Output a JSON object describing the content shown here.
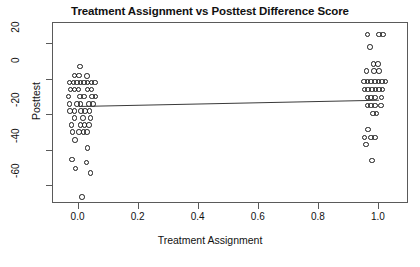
{
  "chart_data": {
    "type": "scatter",
    "title": "Treatment Assignment vs Posttest Difference Score",
    "xlabel": "Treatment Assignment",
    "ylabel": "Posttest",
    "xlim": [
      -0.085,
      1.1
    ],
    "ylim": [
      -70,
      32
    ],
    "grid": false,
    "legend": null,
    "xticks": [
      {
        "value": 0.0,
        "label": "0.0"
      },
      {
        "value": 0.2,
        "label": "0.2"
      },
      {
        "value": 0.4,
        "label": "0.4"
      },
      {
        "value": 0.6,
        "label": "0.6"
      },
      {
        "value": 0.8,
        "label": "0.8"
      },
      {
        "value": 1.0,
        "label": "1.0"
      }
    ],
    "yticks": [
      {
        "value": 20,
        "label": "20"
      },
      {
        "value": 0,
        "label": "0"
      },
      {
        "value": -20,
        "label": "-20"
      },
      {
        "value": -40,
        "label": "-40"
      },
      {
        "value": -60,
        "label": "-60"
      }
    ],
    "annotations": [
      {
        "type": "regression-line",
        "x_start": 0.0,
        "y_start": -14.5,
        "x_end": 1.0,
        "y_end": -11.0
      }
    ],
    "series": [
      {
        "name": "control",
        "x_group": 0.0,
        "marker": "open-circle",
        "color": "#1a1a1a",
        "points": [
          {
            "x": 0.004,
            "y": 7.5
          },
          {
            "x": -0.013,
            "y": 2.5
          },
          {
            "x": 0.002,
            "y": 2.5
          },
          {
            "x": 0.028,
            "y": 2.0
          },
          {
            "x": -0.03,
            "y": -1.5
          },
          {
            "x": -0.017,
            "y": -1.5
          },
          {
            "x": -0.005,
            "y": -1.5
          },
          {
            "x": 0.006,
            "y": -1.5
          },
          {
            "x": 0.018,
            "y": -1.5
          },
          {
            "x": 0.03,
            "y": -1.5
          },
          {
            "x": 0.043,
            "y": -1.5
          },
          {
            "x": 0.055,
            "y": -1.5
          },
          {
            "x": -0.027,
            "y": -5.5
          },
          {
            "x": -0.014,
            "y": -5.5
          },
          {
            "x": 0.0,
            "y": -5.5
          },
          {
            "x": 0.03,
            "y": -5.5
          },
          {
            "x": 0.043,
            "y": -5.5
          },
          {
            "x": -0.033,
            "y": -9.5
          },
          {
            "x": 0.005,
            "y": -9.5
          },
          {
            "x": 0.018,
            "y": -9.5
          },
          {
            "x": 0.044,
            "y": -9.5
          },
          {
            "x": 0.056,
            "y": -9.5
          },
          {
            "x": -0.03,
            "y": -13.5
          },
          {
            "x": -0.006,
            "y": -13.5
          },
          {
            "x": 0.006,
            "y": -13.5
          },
          {
            "x": 0.034,
            "y": -13.5
          },
          {
            "x": 0.048,
            "y": -13.5
          },
          {
            "x": -0.028,
            "y": -17.5
          },
          {
            "x": -0.014,
            "y": -17.5
          },
          {
            "x": 0.008,
            "y": -17.5
          },
          {
            "x": 0.022,
            "y": -17.5
          },
          {
            "x": 0.036,
            "y": -17.5
          },
          {
            "x": -0.014,
            "y": -21.5
          },
          {
            "x": 0.014,
            "y": -21.5
          },
          {
            "x": 0.04,
            "y": -21.5
          },
          {
            "x": -0.024,
            "y": -25.5
          },
          {
            "x": 0.006,
            "y": -25.5
          },
          {
            "x": 0.02,
            "y": -25.5
          },
          {
            "x": 0.034,
            "y": -25.5
          },
          {
            "x": -0.02,
            "y": -29.5
          },
          {
            "x": 0.002,
            "y": -29.5
          },
          {
            "x": 0.016,
            "y": -29.5
          },
          {
            "x": 0.028,
            "y": -29.5
          },
          {
            "x": -0.012,
            "y": -34.0
          },
          {
            "x": 0.03,
            "y": -38.5
          },
          {
            "x": -0.022,
            "y": -45.0
          },
          {
            "x": 0.026,
            "y": -46.5
          },
          {
            "x": -0.01,
            "y": -50.0
          },
          {
            "x": 0.04,
            "y": -52.5
          },
          {
            "x": 0.012,
            "y": -66.0
          }
        ]
      },
      {
        "name": "treatment",
        "x_group": 1.0,
        "marker": "open-circle",
        "color": "#1a1a1a",
        "points": [
          {
            "x": 0.962,
            "y": 25.5
          },
          {
            "x": 1.0,
            "y": 25.5
          },
          {
            "x": 1.014,
            "y": 25.5
          },
          {
            "x": 0.97,
            "y": 18.5
          },
          {
            "x": 0.982,
            "y": 9.0
          },
          {
            "x": 0.996,
            "y": 9.0
          },
          {
            "x": 0.958,
            "y": 5.0
          },
          {
            "x": 0.984,
            "y": 5.0
          },
          {
            "x": 1.0,
            "y": 5.0
          },
          {
            "x": 0.95,
            "y": -1.0
          },
          {
            "x": 0.962,
            "y": -1.0
          },
          {
            "x": 0.974,
            "y": -1.0
          },
          {
            "x": 0.986,
            "y": -1.0
          },
          {
            "x": 0.998,
            "y": -1.0
          },
          {
            "x": 1.01,
            "y": -1.0
          },
          {
            "x": 1.022,
            "y": -1.0
          },
          {
            "x": 0.952,
            "y": -5.5
          },
          {
            "x": 0.964,
            "y": -5.5
          },
          {
            "x": 0.976,
            "y": -5.5
          },
          {
            "x": 0.988,
            "y": -5.5
          },
          {
            "x": 1.0,
            "y": -5.5
          },
          {
            "x": 1.012,
            "y": -5.5
          },
          {
            "x": 0.962,
            "y": -10.0
          },
          {
            "x": 0.974,
            "y": -10.0
          },
          {
            "x": 0.986,
            "y": -10.0
          },
          {
            "x": 1.008,
            "y": -10.0
          },
          {
            "x": 0.962,
            "y": -14.5
          },
          {
            "x": 0.974,
            "y": -14.5
          },
          {
            "x": 0.986,
            "y": -14.5
          },
          {
            "x": 1.006,
            "y": -14.5
          },
          {
            "x": 0.98,
            "y": -19.0
          },
          {
            "x": 0.992,
            "y": -19.0
          },
          {
            "x": 0.964,
            "y": -28.0
          },
          {
            "x": 0.952,
            "y": -32.5
          },
          {
            "x": 0.974,
            "y": -32.5
          },
          {
            "x": 0.986,
            "y": -32.5
          },
          {
            "x": 0.956,
            "y": -36.5
          },
          {
            "x": 0.976,
            "y": -45.5
          }
        ]
      }
    ]
  }
}
